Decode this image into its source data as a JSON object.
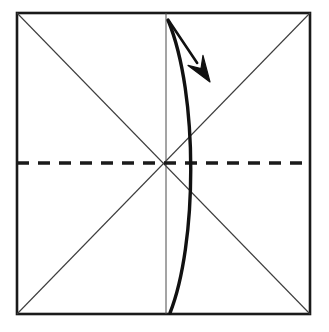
{
  "canvas": {
    "width": 329,
    "height": 332,
    "background": "#ffffff",
    "title": "Origami fold step diagram"
  },
  "colors": {
    "ink": "#1a1a1a",
    "thin_line": "#3d3d3d",
    "paper": "#ffffff"
  },
  "figure": {
    "type": "origami-fold-diagram",
    "square": {
      "label": "paper-square",
      "left": 17,
      "top": 13,
      "right": 310,
      "bottom": 314,
      "stroke": "#1a1a1a",
      "stroke_width": 2.6
    },
    "creases": [
      {
        "name": "diagonal-tl-br",
        "style": "solid-thin",
        "x1": 17,
        "y1": 13,
        "x2": 310,
        "y2": 314,
        "stroke_width": 1.1
      },
      {
        "name": "diagonal-bl-tr",
        "style": "solid-thin",
        "x1": 17,
        "y1": 314,
        "x2": 310,
        "y2": 13,
        "stroke_width": 1.1
      },
      {
        "name": "vertical-centre",
        "style": "solid-thin",
        "x1": 166,
        "y1": 13,
        "x2": 166,
        "y2": 314,
        "stroke_width": 1.0
      },
      {
        "name": "horizontal-centre-valley",
        "style": "dashed-thick",
        "x1": 17,
        "y1": 163,
        "x2": 310,
        "y2": 163,
        "stroke_width": 3.4,
        "dash_pattern": "12 9"
      }
    ],
    "curve": {
      "name": "fold-arc",
      "style": "solid-thick",
      "stroke_width": 3.4,
      "start": [
        168,
        20
      ],
      "control1": [
        199,
        95
      ],
      "control2": [
        197,
        245
      ],
      "end": [
        170,
        313
      ],
      "bulge_apex": [
        193,
        172
      ]
    },
    "arrow": {
      "name": "fold-direction-arrow",
      "tail": [
        169,
        21
      ],
      "tip": [
        210,
        82
      ],
      "shaft_width": 2.6,
      "head": {
        "shape": "solid-triangle-concave",
        "length": 26,
        "half_width": 9
      }
    },
    "centre_point": [
      166,
      163
    ]
  }
}
